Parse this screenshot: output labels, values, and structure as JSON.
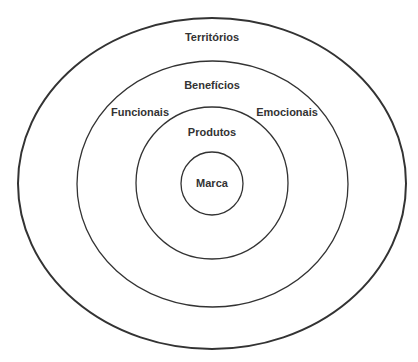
{
  "diagram": {
    "type": "concentric-ellipses",
    "stroke_color": "#333333",
    "layers": [
      {
        "name": "Territórios",
        "cx": 212,
        "cy": 183.5,
        "rx": 194,
        "ry": 165.5,
        "stroke_width": 2
      },
      {
        "name": "Benefícios",
        "cx": 212.5,
        "cy": 184,
        "rx": 135.5,
        "ry": 123,
        "stroke_width": 1.3
      },
      {
        "name": "Produtos",
        "cx": 212,
        "cy": 183,
        "rx": 76,
        "ry": 76,
        "stroke_width": 1.3
      },
      {
        "name": "Marca",
        "cx": 212,
        "cy": 183.5,
        "rx": 31,
        "ry": 31.5,
        "stroke_width": 1.3
      }
    ],
    "labels": {
      "territorios": "Territórios",
      "beneficios": "Benefícios",
      "funcionais": "Funcionais",
      "emocionais": "Emocionais",
      "produtos": "Produtos",
      "marca": "Marca"
    }
  }
}
